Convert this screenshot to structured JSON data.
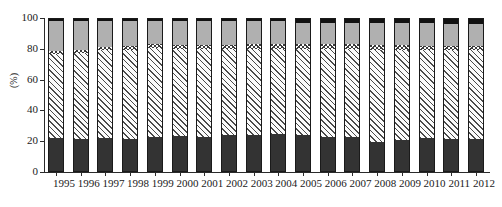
{
  "chart_data": {
    "type": "bar",
    "stacked": true,
    "title": "",
    "subtitle": "",
    "xlabel": "",
    "ylabel": "(%)",
    "ylim": [
      0,
      100
    ],
    "yticks": [
      0,
      20,
      40,
      60,
      80,
      100
    ],
    "grid": false,
    "legend": "none",
    "categories": [
      "1995",
      "1996",
      "1997",
      "1998",
      "1999",
      "2000",
      "2001",
      "2002",
      "2003",
      "2004",
      "2005",
      "2006",
      "2007",
      "2008",
      "2009",
      "2010",
      "2011",
      "2012"
    ],
    "series": [
      {
        "name": "segment-1-solid-dark",
        "pattern": "solid-dark",
        "color": "#333333",
        "values": [
          22,
          21.5,
          22,
          21.5,
          23,
          23.5,
          22.5,
          24,
          24,
          25,
          24,
          23,
          23,
          19.5,
          21,
          22,
          21.5,
          21.5
        ]
      },
      {
        "name": "segment-2-diagonal-hatch",
        "pattern": "diagonal-hatch",
        "color": "#fbfbfb",
        "values": [
          54.5,
          55.5,
          57.5,
          58,
          57.5,
          56.5,
          57.5,
          56,
          56,
          55,
          56,
          57,
          57,
          60,
          58.5,
          57,
          57.5,
          57.5
        ]
      },
      {
        "name": "segment-3-cross-hatch",
        "pattern": "cross-hatch",
        "color": "#fdfdfd",
        "values": [
          2,
          2,
          2,
          2.5,
          2.5,
          2.5,
          2.5,
          2.5,
          3,
          3,
          3,
          3,
          3,
          3,
          3,
          3,
          3,
          3
        ]
      },
      {
        "name": "segment-4-solid-gray",
        "pattern": "solid-gray",
        "color": "#b0b0b0",
        "values": [
          19.5,
          19,
          16.5,
          16,
          15,
          15.5,
          15.5,
          15.5,
          15,
          15,
          14,
          14,
          14,
          14.5,
          14.5,
          15,
          14,
          14
        ]
      },
      {
        "name": "segment-5-solid-black",
        "pattern": "solid-black",
        "color": "#111111",
        "values": [
          2,
          2,
          2,
          2,
          2,
          2,
          2,
          2,
          2,
          2,
          3,
          3,
          3,
          3,
          3,
          3,
          4,
          4
        ]
      }
    ]
  },
  "axis": {
    "y_label": "(%)",
    "y_tick_labels": [
      "100",
      "80",
      "60",
      "40",
      "20",
      "0"
    ]
  }
}
